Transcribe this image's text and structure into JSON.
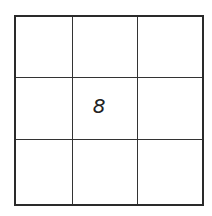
{
  "grid": {
    "rows": 3,
    "cols": 3,
    "cells": [
      [
        "",
        "",
        ""
      ],
      [
        "",
        "8",
        ""
      ],
      [
        "",
        "",
        ""
      ]
    ]
  }
}
